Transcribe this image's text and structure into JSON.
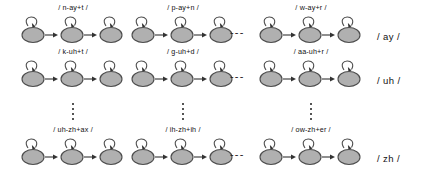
{
  "diagram": {
    "type": "hmm-triphone-state-grid",
    "colors": {
      "state_fill": "#b0b0b0",
      "state_stroke": "#4d4d4d",
      "arrow": "#333333",
      "text": "#111111",
      "background": "#ffffff"
    },
    "states_per_model": 3,
    "rows": [
      {
        "phoneme_label": "/ ay /",
        "models": [
          {
            "label": "/ n-ay+t /"
          },
          {
            "label": "/ p-ay+n /"
          },
          {
            "label": "/ w-ay+r /"
          }
        ],
        "column_ellipsis": "---"
      },
      {
        "phoneme_label": "/ uh /",
        "models": [
          {
            "label": "/ k-uh+t /"
          },
          {
            "label": "/ g-uh+d /"
          },
          {
            "label": "/ aa-uh+r /"
          }
        ],
        "column_ellipsis": "---"
      },
      {
        "phoneme_label": "/ zh /",
        "models": [
          {
            "label": "/ uh-zh+ax /"
          },
          {
            "label": "/ ih-zh+ih /"
          },
          {
            "label": "/ ow-zh+er /"
          }
        ],
        "column_ellipsis": "---"
      }
    ],
    "row_ellipsis_positions": [
      "column-1",
      "column-2",
      "column-3"
    ]
  }
}
